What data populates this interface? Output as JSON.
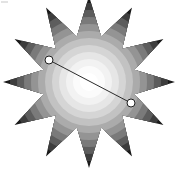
{
  "image": {
    "title": "12-point starburst with radial grayscale rings and annotation line",
    "width": 178,
    "height": 169,
    "background_color": "#ffffff"
  },
  "figure": {
    "center": {
      "x": 89,
      "y": 82
    },
    "star": {
      "points": 12,
      "outer_radius": 86,
      "inner_radius": 47,
      "start_angle_deg": -90,
      "tip_count_label": "12"
    },
    "rings": [
      {
        "index": 0,
        "radius": 9,
        "color": "#ffffff"
      },
      {
        "index": 1,
        "radius": 16,
        "color": "#fbfbfb"
      },
      {
        "index": 2,
        "radius": 23,
        "color": "#f2f2f2"
      },
      {
        "index": 3,
        "radius": 30,
        "color": "#e6e6e6"
      },
      {
        "index": 4,
        "radius": 37,
        "color": "#d5d5d5"
      },
      {
        "index": 5,
        "radius": 44,
        "color": "#c2c2c2"
      },
      {
        "index": 6,
        "radius": 51,
        "color": "#ababab"
      },
      {
        "index": 7,
        "radius": 58,
        "color": "#949494"
      },
      {
        "index": 8,
        "radius": 65,
        "color": "#7a7a7a"
      },
      {
        "index": 9,
        "radius": 72,
        "color": "#5d5d5d"
      },
      {
        "index": 10,
        "radius": 79,
        "color": "#3d3d3d"
      },
      {
        "index": 11,
        "radius": 86,
        "color": "#1a1a1a"
      }
    ],
    "annotation": {
      "line_color": "#2b2b2b",
      "line_width": 1,
      "handle_fill": "#ffffff",
      "handle_stroke": "#1f1f1f",
      "handle_radius": 4,
      "start_point": {
        "x": 49,
        "y": 60,
        "label": "P1"
      },
      "end_point": {
        "x": 131,
        "y": 103,
        "label": "P2"
      }
    }
  },
  "colors": {
    "darkest": "#1a1a1a",
    "lightest": "#ffffff",
    "line": "#2b2b2b"
  }
}
